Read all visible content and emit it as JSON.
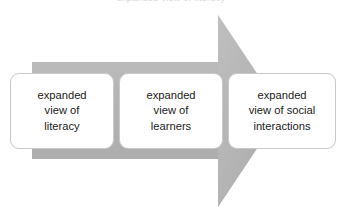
{
  "diagram": {
    "title_remnant": "expanded view of literacy",
    "arrow": {
      "direction": "right",
      "fill_color": "#b5b5b5",
      "fill_color_light": "#c4c4c4",
      "fill_color_dark": "#a9a9a9",
      "icon_name": "right-arrow-shape"
    },
    "boxes": [
      {
        "id": "box-1",
        "label": "expanded\nview of\nliteracy",
        "border_color": "#c9c9c9",
        "background_color": "#ffffff",
        "text_color": "#1b1b1b"
      },
      {
        "id": "box-2",
        "label": "expanded\nview of\nlearners",
        "border_color": "#c9c9c9",
        "background_color": "#ffffff",
        "text_color": "#1b1b1b"
      },
      {
        "id": "box-3",
        "label": "expanded\nview of social\ninteractions",
        "border_color": "#c9c9c9",
        "background_color": "#ffffff",
        "text_color": "#1b1b1b"
      }
    ]
  }
}
